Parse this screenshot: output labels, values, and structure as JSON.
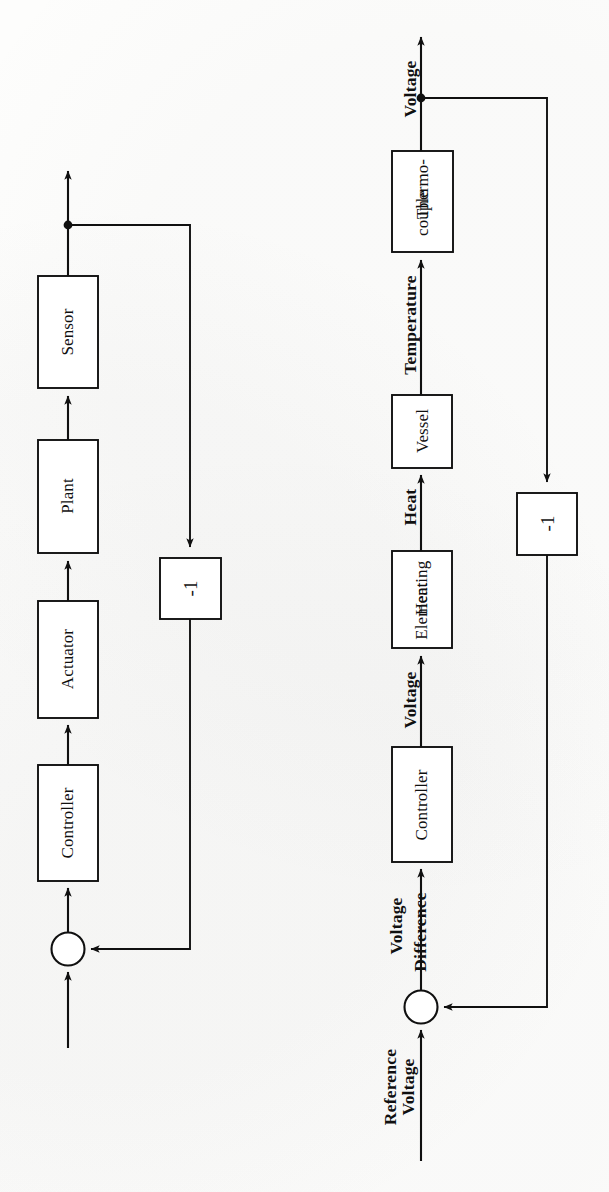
{
  "page": {
    "kind": "scanned-figure-page",
    "orientation": "rotated-90-ccw",
    "background_color": "#fdfdfc",
    "ink_color": "#101010"
  },
  "diagrams": [
    {
      "id": "generic-feedback-loop",
      "name": "Generic closed-loop control block diagram",
      "blocks": [
        {
          "id": "controller",
          "label": "Controller"
        },
        {
          "id": "actuator",
          "label": "Actuator"
        },
        {
          "id": "plant",
          "label": "Plant"
        },
        {
          "id": "sensor",
          "label": "Sensor"
        },
        {
          "id": "gain",
          "label": "-1"
        }
      ],
      "summing_junction": {
        "id": "sum",
        "label": ""
      },
      "signal_labels": [],
      "input_label": "",
      "output_label": ""
    },
    {
      "id": "temperature-control-loop",
      "name": "Temperature control block diagram",
      "blocks": [
        {
          "id": "controller",
          "label": "Controller"
        },
        {
          "id": "heating-element",
          "label": "Heating\nElement"
        },
        {
          "id": "vessel",
          "label": "Vessel"
        },
        {
          "id": "thermocouple",
          "label": "Thermo-\ncouple"
        },
        {
          "id": "gain",
          "label": "-1"
        }
      ],
      "summing_junction": {
        "id": "sum",
        "label": ""
      },
      "signal_labels": [
        {
          "id": "reference-voltage",
          "label": "Reference"
        },
        {
          "id": "reference-voltage2",
          "label": "Voltage"
        },
        {
          "id": "voltage-difference",
          "label": "Voltage"
        },
        {
          "id": "voltage-difference2",
          "label": "Difference"
        },
        {
          "id": "controller-output",
          "label": "Voltage"
        },
        {
          "id": "heat",
          "label": "Heat"
        },
        {
          "id": "temperature",
          "label": "Temperature"
        },
        {
          "id": "output-voltage",
          "label": "Voltage"
        }
      ]
    }
  ]
}
